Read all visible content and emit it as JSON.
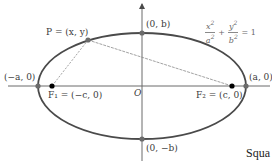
{
  "diagram": {
    "equation": {
      "term1_num": "x",
      "term1_den": "a",
      "term2_num": "y",
      "term2_den": "b",
      "exp": "2",
      "plus": "+",
      "equals": "= 1"
    },
    "labels": {
      "point_p": "P = (x, y)",
      "top_vertex": "(0, b)",
      "bottom_vertex": "(0, −b)",
      "left_vertex": "(−a, 0)",
      "right_vertex": "(a, 0)",
      "focus1": "F₁ = (−c, 0)",
      "focus2": "F₂ = (c, 0)",
      "origin": "O"
    },
    "caption_fragment": "Squa",
    "colors": {
      "ellipse": "#4a4a4a",
      "axes": "#6b6b6b",
      "focus_dot": "#000000",
      "vertex_dot": "#6b6b6b",
      "dashed_line": "#8a8a8a"
    },
    "geometry": {
      "center": [
        142,
        86
      ],
      "a_px": 104,
      "b_px": 53,
      "focus1": [
        52,
        86
      ],
      "focus2": [
        232,
        86
      ],
      "point_p": [
        88,
        40
      ]
    }
  }
}
